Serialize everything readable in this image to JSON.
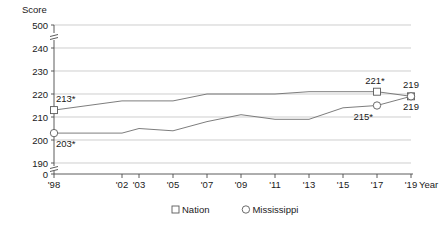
{
  "chart_data": {
    "type": "line",
    "title": "",
    "ylabel": "Score",
    "xlabel": "Year",
    "grid": true,
    "legend_position": "bottom",
    "axis_break": true,
    "ylim": [
      0,
      500
    ],
    "y_ticks": [
      "0",
      "190",
      "200",
      "210",
      "220",
      "230",
      "240",
      "500"
    ],
    "y_tick_values": [
      0,
      190,
      200,
      210,
      220,
      230,
      240,
      500
    ],
    "x_tick_labels": [
      "'98",
      "'02",
      "'03",
      "'05",
      "'07",
      "'09",
      "'11",
      "'13",
      "'15",
      "'17",
      "'19"
    ],
    "x_values": [
      1998,
      2002,
      2003,
      2005,
      2007,
      2009,
      2011,
      2013,
      2015,
      2017,
      2019
    ],
    "series": [
      {
        "name": "Nation",
        "marker": "square",
        "values": [
          213,
          217,
          217,
          217,
          220,
          220,
          220,
          221,
          221,
          221,
          219
        ],
        "point_labels": [
          {
            "x": 1998,
            "y": 213,
            "text": "213*"
          },
          {
            "x": 2017,
            "y": 221,
            "text": "221*"
          },
          {
            "x": 2019,
            "y": 219,
            "text": "219"
          }
        ]
      },
      {
        "name": "Mississippi",
        "marker": "circle",
        "values": [
          203,
          203,
          205,
          204,
          208,
          211,
          209,
          209,
          214,
          215,
          219
        ],
        "point_labels": [
          {
            "x": 1998,
            "y": 203,
            "text": "203*"
          },
          {
            "x": 2017,
            "y": 215,
            "text": "215*"
          },
          {
            "x": 2019,
            "y": 219,
            "text": "219"
          }
        ]
      }
    ],
    "legend": [
      {
        "label": "Nation",
        "marker": "square"
      },
      {
        "label": "Mississippi",
        "marker": "circle"
      }
    ]
  }
}
